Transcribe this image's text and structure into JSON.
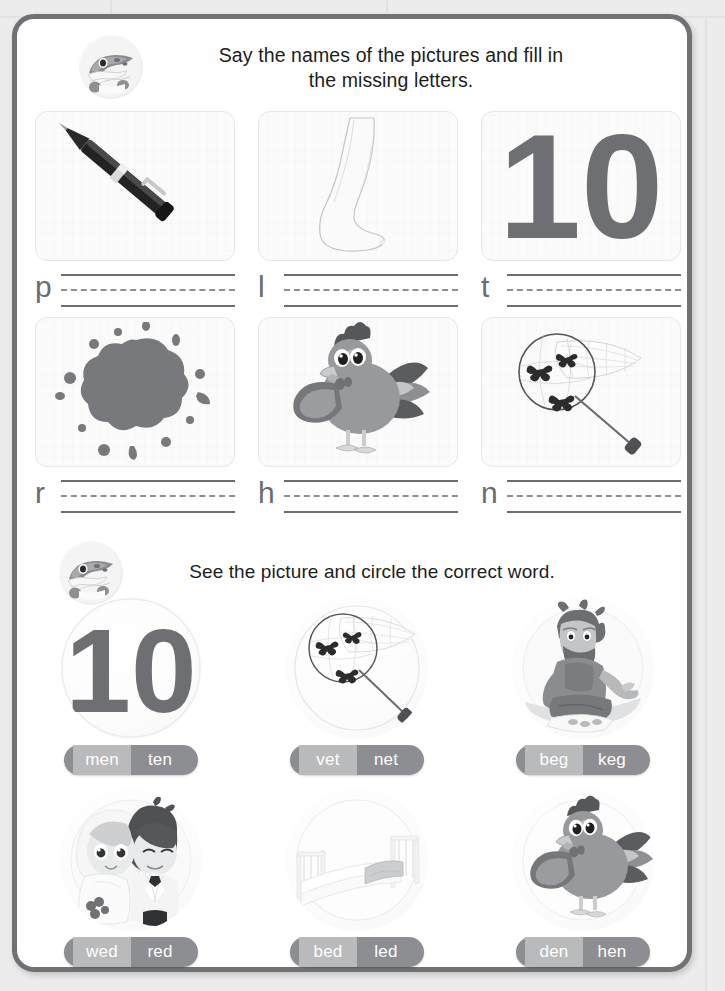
{
  "page": {
    "border_color": "#6f7174",
    "background_color": "#ececed"
  },
  "section_one": {
    "mascot_icon": "crocodile-mascot-icon",
    "instruction": "Say the names of the pictures and fill in the missing letters.",
    "instruction_line_1": "Say the names of the pictures and fill in",
    "instruction_line_2": "the missing letters.",
    "items": [
      {
        "picture_icon": "pen-icon",
        "picture_label": "pen",
        "letter": "p"
      },
      {
        "picture_icon": "leg-icon",
        "picture_label": "leg",
        "letter": "l"
      },
      {
        "picture_icon": "ten-icon",
        "picture_label": "10",
        "letter": "t"
      },
      {
        "picture_icon": "red-blot-icon",
        "picture_label": "red",
        "letter": "r"
      },
      {
        "picture_icon": "hen-icon",
        "picture_label": "hen",
        "letter": "h"
      },
      {
        "picture_icon": "net-icon",
        "picture_label": "net",
        "letter": "n"
      }
    ]
  },
  "section_two": {
    "mascot_icon": "crocodile-mascot-icon",
    "instruction": "See the picture and circle the correct word.",
    "items": [
      {
        "picture_icon": "ten-circle-icon",
        "picture_label": "10",
        "options": [
          "men",
          "ten"
        ]
      },
      {
        "picture_icon": "net-circle-icon",
        "picture_label": "net",
        "options": [
          "vet",
          "net"
        ]
      },
      {
        "picture_icon": "beggar-circle-icon",
        "picture_label": "beggar",
        "options": [
          "beg",
          "keg"
        ]
      },
      {
        "picture_icon": "wedding-circle-icon",
        "picture_label": "wedding",
        "options": [
          "wed",
          "red"
        ]
      },
      {
        "picture_icon": "bed-circle-icon",
        "picture_label": "bed",
        "options": [
          "bed",
          "led"
        ]
      },
      {
        "picture_icon": "hen-circle-icon",
        "picture_label": "hen",
        "options": [
          "den",
          "hen"
        ]
      }
    ]
  },
  "colors": {
    "pill_background": "#8c8e91",
    "pill_first_option_background": "#b9babc",
    "pill_text": "#ffffff",
    "line_color": "#6a6c6e",
    "letter_color": "#6a6c6e"
  }
}
